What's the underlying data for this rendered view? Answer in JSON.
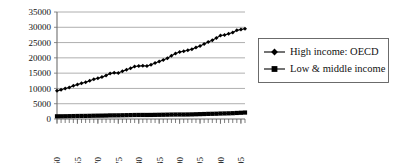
{
  "chart_data": {
    "type": "line",
    "title": "",
    "subtitle": "",
    "xlabel": "",
    "ylabel": "",
    "xlim": [
      1960,
      2006
    ],
    "ylim": [
      0,
      35000
    ],
    "ytick_labels": [
      "0",
      "5000",
      "10000",
      "15000",
      "20000",
      "25000",
      "30000",
      "35000"
    ],
    "ytick_values": [
      0,
      5000,
      10000,
      15000,
      20000,
      25000,
      30000,
      35000
    ],
    "xtick_labels": [
      "1960",
      "1965",
      "1970",
      "1975",
      "1980",
      "1985",
      "1990",
      "1995",
      "2000",
      "2005"
    ],
    "xtick_values": [
      1960,
      1965,
      1970,
      1975,
      1980,
      1985,
      1990,
      1995,
      2000,
      2005
    ],
    "grid": "horizontal",
    "legend_position": "right",
    "x": [
      1960,
      1961,
      1962,
      1963,
      1964,
      1965,
      1966,
      1967,
      1968,
      1969,
      1970,
      1971,
      1972,
      1973,
      1974,
      1975,
      1976,
      1977,
      1978,
      1979,
      1980,
      1981,
      1982,
      1983,
      1984,
      1985,
      1986,
      1987,
      1988,
      1989,
      1990,
      1991,
      1992,
      1993,
      1994,
      1995,
      1996,
      1997,
      1998,
      1999,
      2000,
      2001,
      2002,
      2003,
      2004,
      2005,
      2006
    ],
    "series": [
      {
        "name": "High income: OECD",
        "marker": "diamond",
        "color": "#000000",
        "values": [
          9200,
          9550,
          9950,
          10300,
          10850,
          11250,
          11700,
          12000,
          12500,
          13000,
          13350,
          13700,
          14200,
          14900,
          15100,
          15050,
          15650,
          16100,
          16600,
          17200,
          17350,
          17400,
          17350,
          17750,
          18300,
          18800,
          19300,
          19900,
          20700,
          21400,
          21900,
          22150,
          22500,
          22800,
          23400,
          23900,
          24500,
          25200,
          25800,
          26500,
          27300,
          27500,
          27900,
          28300,
          29000,
          29300,
          29500
        ]
      },
      {
        "name": "Low & middle income",
        "marker": "square",
        "color": "#000000",
        "values": [
          880,
          890,
          905,
          930,
          960,
          985,
          1000,
          1010,
          1035,
          1070,
          1090,
          1105,
          1130,
          1180,
          1190,
          1200,
          1230,
          1255,
          1285,
          1310,
          1320,
          1325,
          1320,
          1330,
          1355,
          1375,
          1395,
          1420,
          1450,
          1465,
          1470,
          1465,
          1480,
          1505,
          1545,
          1585,
          1630,
          1675,
          1700,
          1730,
          1790,
          1820,
          1855,
          1900,
          1975,
          2040,
          2110
        ]
      }
    ]
  },
  "legend": {
    "entries": [
      {
        "label": "High income: OECD",
        "marker": "diamond"
      },
      {
        "label": "Low & middle income",
        "marker": "square"
      }
    ]
  }
}
